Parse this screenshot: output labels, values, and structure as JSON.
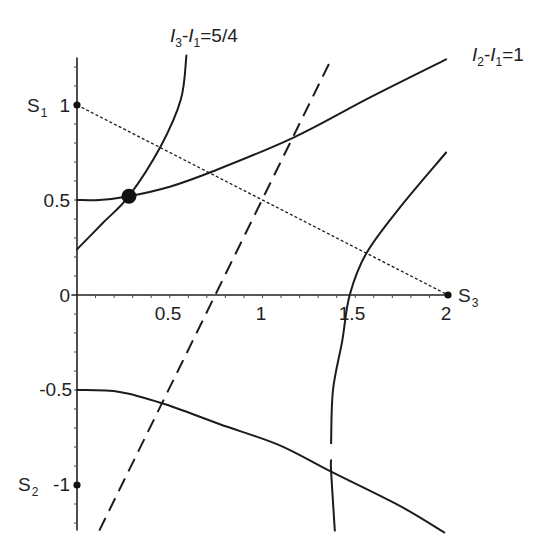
{
  "chart_data": {
    "type": "line",
    "title": "",
    "xlabel": "",
    "ylabel": "",
    "xlim": [
      0,
      2
    ],
    "ylim": [
      -1.25,
      1.25
    ],
    "grid": false,
    "legend": null,
    "axes": {
      "x_range": [
        -0.03,
        2.0
      ],
      "y_range": [
        -1.24,
        1.25
      ],
      "minor_tick_step": 0.1
    },
    "xticks": {
      "values": [
        0.5,
        1,
        1.5,
        2
      ],
      "labels": [
        "0.5",
        "1",
        "1.5",
        "2"
      ]
    },
    "yticks": {
      "values": [
        1,
        0.5,
        0,
        -0.5,
        -1
      ],
      "labels": [
        "1",
        "0.5",
        "0",
        "-0.5",
        "-1"
      ]
    },
    "series": [
      {
        "name": "I3-I1=5/4 (left branch)",
        "style": "solid",
        "x": [
          0,
          0.14,
          0.28,
          0.45,
          0.56,
          0.59
        ],
        "y": [
          0.24,
          0.38,
          0.52,
          0.78,
          1.03,
          1.26
        ]
      },
      {
        "name": "I2-I1=1 (upper branch)",
        "style": "solid",
        "x": [
          0,
          0.12,
          0.28,
          0.5,
          0.73,
          1.17,
          1.58,
          1.99
        ],
        "y": [
          0.5,
          0.5,
          0.52,
          0.57,
          0.65,
          0.83,
          1.04,
          1.24
        ]
      },
      {
        "name": "I2-I1=1 (lower branch)",
        "style": "solid",
        "x": [
          0,
          0.23,
          0.46,
          0.77,
          1.09,
          1.37,
          1.74,
          1.98
        ],
        "y": [
          -0.5,
          -0.51,
          -0.57,
          -0.68,
          -0.79,
          -0.93,
          -1.11,
          -1.25
        ]
      },
      {
        "name": "I3-I1=5/4 (right branch, upper segment)",
        "style": "solid",
        "x": [
          1.99,
          1.74,
          1.56,
          1.47,
          1.43,
          1.38,
          1.37
        ],
        "y": [
          0.75,
          0.46,
          0.22,
          0,
          -0.24,
          -0.5,
          -0.78
        ]
      },
      {
        "name": "I3-I1=5/4 (right branch, lower segment)",
        "style": "solid",
        "x": [
          1.37,
          1.37,
          1.39
        ],
        "y": [
          -0.87,
          -0.93,
          -1.24
        ]
      },
      {
        "name": "dashed line",
        "style": "dashed",
        "x": [
          0.12,
          1.36
        ],
        "y": [
          -1.24,
          1.22
        ]
      },
      {
        "name": "S1-S3 segment",
        "style": "dotted",
        "x": [
          0,
          2
        ],
        "y": [
          1,
          0
        ]
      }
    ],
    "points": [
      {
        "name": "S1",
        "x": 0,
        "y": 1,
        "size": "small"
      },
      {
        "name": "S2",
        "x": 0,
        "y": -1,
        "size": "small"
      },
      {
        "name": "S3",
        "x": 2,
        "y": 0,
        "size": "small"
      },
      {
        "name": "intersection",
        "x": 0.28,
        "y": 0.52,
        "size": "large"
      }
    ],
    "annotations": [
      {
        "text": "I3-I1=5/4",
        "near": "top of left branch"
      },
      {
        "text": "I2-I1=1",
        "near": "end of upper branch"
      },
      {
        "text": "S1",
        "at": [
          0,
          1
        ]
      },
      {
        "text": "S2",
        "at": [
          0,
          -1
        ]
      },
      {
        "text": "S3",
        "at": [
          2,
          0
        ]
      }
    ]
  },
  "labels": {
    "curve_a": {
      "i1": "I",
      "s1": "3",
      "dash": "-",
      "i2": "I",
      "s2": "1",
      "rhs": "=5/4"
    },
    "curve_b": {
      "i1": "I",
      "s1": "2",
      "dash": "-",
      "i2": "I",
      "s2": "1",
      "rhs": "=1"
    },
    "s1": {
      "main": "S",
      "sub": "1"
    },
    "s2": {
      "main": "S",
      "sub": "2"
    },
    "s3": {
      "main": "S",
      "sub": "3"
    }
  },
  "style": {
    "line_color": "#1c1c1c",
    "text_color": "#222222",
    "background": "#ffffff"
  }
}
